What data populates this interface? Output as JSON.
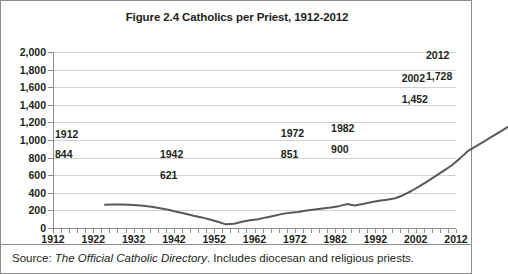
{
  "chart_data": {
    "type": "line",
    "title": "Figure 2.4 Catholics per Priest, 1912-2012",
    "xlabel": "",
    "ylabel": "",
    "xlim": [
      1912,
      2012
    ],
    "ylim": [
      0,
      2000
    ],
    "grid": true,
    "legend": "none",
    "y_ticks": [
      "2,000",
      "1,800",
      "1,600",
      "1,400",
      "1,200",
      "1,000",
      "800",
      "600",
      "400",
      "200",
      "0"
    ],
    "y_tick_values": [
      2000,
      1800,
      1600,
      1400,
      1200,
      1000,
      800,
      600,
      400,
      200,
      0
    ],
    "x_ticks": [
      "1912",
      "1922",
      "1932",
      "1942",
      "1952",
      "1962",
      "1972",
      "1982",
      "1992",
      "2002",
      "2012"
    ],
    "x_tick_values": [
      1912,
      1922,
      1932,
      1942,
      1952,
      1962,
      1972,
      1982,
      1992,
      2002,
      2012
    ],
    "x_minor_tick_step": 2,
    "series": [
      {
        "name": "Catholics per Priest",
        "color": "#595959",
        "x": [
          1912,
          1914,
          1916,
          1918,
          1920,
          1922,
          1924,
          1926,
          1928,
          1930,
          1932,
          1934,
          1936,
          1938,
          1940,
          1942,
          1944,
          1946,
          1948,
          1950,
          1952,
          1954,
          1956,
          1958,
          1960,
          1962,
          1964,
          1966,
          1968,
          1970,
          1972,
          1974,
          1976,
          1978,
          1980,
          1982,
          1984,
          1986,
          1988,
          1990,
          1992,
          1994,
          1996,
          1998,
          2000,
          2002,
          2004,
          2006,
          2008,
          2010,
          2012
        ],
        "values": [
          844,
          846,
          848,
          845,
          838,
          830,
          818,
          800,
          784,
          762,
          742,
          718,
          700,
          676,
          650,
          621,
          628,
          650,
          668,
          678,
          700,
          718,
          740,
          752,
          762,
          778,
          790,
          800,
          812,
          828,
          851,
          836,
          852,
          872,
          888,
          900,
          918,
          952,
          1000,
          1052,
          1110,
          1168,
          1228,
          1290,
          1368,
          1452,
          1508,
          1562,
          1618,
          1672,
          1728
        ]
      }
    ],
    "annotations": [
      {
        "year": "1912",
        "value": "844",
        "x": 1912,
        "y": 844
      },
      {
        "year": "1942",
        "value": "621",
        "x": 1942,
        "y": 621
      },
      {
        "year": "1972",
        "value": "851",
        "x": 1972,
        "y": 851
      },
      {
        "year": "1982",
        "value": "900",
        "x": 1982,
        "y": 900
      },
      {
        "year": "2002",
        "value": "1,452",
        "x": 2002,
        "y": 1452
      },
      {
        "year": "2012",
        "value": "1,728",
        "x": 2012,
        "y": 1728
      }
    ]
  },
  "source": {
    "prefix": "Source: ",
    "italic": "The Official Catholic Directory",
    "suffix": ". Includes diocesan and religious priests."
  }
}
